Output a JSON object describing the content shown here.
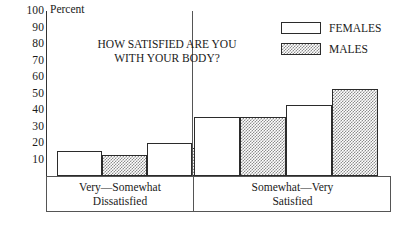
{
  "axis": {
    "unit_label": "Percent",
    "y_ticks": [
      "100",
      "90",
      "80",
      "70",
      "60",
      "50",
      "40",
      "30",
      "20",
      "10"
    ]
  },
  "title": {
    "line1": "HOW SATISFIED ARE YOU",
    "line2": "WITH YOUR BODY?"
  },
  "legend": {
    "items": [
      {
        "label": "FEMALES",
        "swatch": "white-swatch"
      },
      {
        "label": "MALES",
        "swatch": "stippled-swatch"
      }
    ]
  },
  "categories_axis": [
    {
      "line1": "Very—Somewhat",
      "line2": "Dissatisfied"
    },
    {
      "line1": "Somewhat—Very",
      "line2": "Satisfied"
    }
  ],
  "colors": {
    "females_fill": "#ffffff",
    "males_fill": "#8d8d8d",
    "outline": "#2b2b2b",
    "axis": "#555555",
    "text": "#1a1a1a",
    "background": "#ffffff"
  },
  "chart_data": {
    "type": "bar",
    "title": "HOW SATISFIED ARE YOU WITH YOUR BODY?",
    "xlabel": "",
    "ylabel": "Percent",
    "ylim": [
      0,
      100
    ],
    "ytick_step": 10,
    "grid": false,
    "legend_position": "top-right",
    "categories": [
      "Very—Somewhat Dissatisfied",
      "Very—Somewhat Dissatisfied",
      "Somewhat—Very Satisfied",
      "Somewhat—Very Satisfied"
    ],
    "series": [
      {
        "name": "FEMALES",
        "values": [
          15,
          20,
          36,
          43
        ]
      },
      {
        "name": "MALES",
        "values": [
          13,
          17,
          36,
          53
        ]
      }
    ],
    "bars": [
      {
        "group": "Very—Somewhat Dissatisfied",
        "series": "FEMALES",
        "value": 15
      },
      {
        "group": "Very—Somewhat Dissatisfied",
        "series": "MALES",
        "value": 13
      },
      {
        "group": "Very—Somewhat Dissatisfied",
        "series": "FEMALES",
        "value": 20
      },
      {
        "group": "Very—Somewhat Dissatisfied",
        "series": "MALES",
        "value": 17
      },
      {
        "group": "Somewhat—Very Satisfied",
        "series": "FEMALES",
        "value": 36
      },
      {
        "group": "Somewhat—Very Satisfied",
        "series": "MALES",
        "value": 36
      },
      {
        "group": "Somewhat—Very Satisfied",
        "series": "FEMALES",
        "value": 43
      },
      {
        "group": "Somewhat—Very Satisfied",
        "series": "MALES",
        "value": 53
      }
    ]
  },
  "bar_layout": [
    {
      "left": 11,
      "width": 44
    },
    {
      "left": 55,
      "width": 44
    },
    {
      "left": 99,
      "width": 44
    },
    {
      "left": 143,
      "width": 44
    },
    {
      "left": 193,
      "width": 46
    },
    {
      "left": 239,
      "width": 46
    },
    {
      "left": 143,
      "width": 0
    },
    {
      "left": 0,
      "width": 0
    }
  ]
}
